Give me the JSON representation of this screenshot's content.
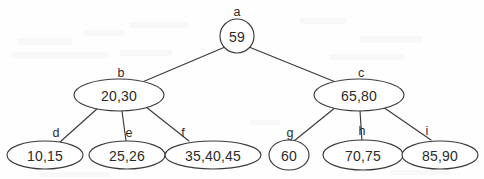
{
  "figure": {
    "type": "tree-diagram",
    "width": 484,
    "height": 179,
    "background_color": "#fefefe",
    "stroke_color": "#3a3a3a",
    "text_color": "#2b2b2b"
  },
  "nodes": {
    "a": {
      "label": "a",
      "value": "59",
      "shape": "circle",
      "level": 0,
      "cx": 237,
      "cy": 36,
      "rx": 17,
      "ry": 17,
      "label_x": 237,
      "label_y": 12
    },
    "b": {
      "label": "b",
      "value": "20,30",
      "shape": "ellipse",
      "level": 1,
      "cx": 119,
      "cy": 95,
      "rx": 45,
      "ry": 16,
      "label_x": 121,
      "label_y": 73
    },
    "c": {
      "label": "c",
      "value": "65,80",
      "shape": "ellipse",
      "level": 1,
      "cx": 359,
      "cy": 95,
      "rx": 45,
      "ry": 16,
      "label_x": 361,
      "label_y": 73
    },
    "d": {
      "label": "d",
      "value": "10,15",
      "shape": "ellipse",
      "level": 2,
      "cx": 45,
      "cy": 155,
      "rx": 38,
      "ry": 14,
      "label_x": 56,
      "label_y": 133
    },
    "e": {
      "label": "e",
      "value": "25,26",
      "shape": "ellipse",
      "level": 2,
      "cx": 127,
      "cy": 155,
      "rx": 38,
      "ry": 14,
      "label_x": 129,
      "label_y": 133
    },
    "f": {
      "label": "f",
      "value": "35,40,45",
      "shape": "ellipse",
      "level": 2,
      "cx": 213,
      "cy": 155,
      "rx": 48,
      "ry": 14,
      "label_x": 183,
      "label_y": 133
    },
    "g": {
      "label": "g",
      "value": "60",
      "shape": "circle",
      "level": 2,
      "cx": 289,
      "cy": 155,
      "rx": 20,
      "ry": 15,
      "label_x": 290,
      "label_y": 133
    },
    "h": {
      "label": "h",
      "value": "70,75",
      "shape": "ellipse",
      "level": 2,
      "cx": 363,
      "cy": 155,
      "rx": 40,
      "ry": 15,
      "label_x": 362,
      "label_y": 131
    },
    "i": {
      "label": "i",
      "value": "85,90",
      "shape": "ellipse",
      "level": 2,
      "cx": 440,
      "cy": 155,
      "rx": 38,
      "ry": 14,
      "label_x": 427,
      "label_y": 131
    }
  },
  "edges": [
    {
      "name": "edge-a-b",
      "from": "a",
      "to": "b",
      "x1": 225,
      "y1": 47,
      "x2": 140,
      "y2": 83
    },
    {
      "name": "edge-a-c",
      "from": "a",
      "to": "c",
      "x1": 249,
      "y1": 47,
      "x2": 338,
      "y2": 83
    },
    {
      "name": "edge-b-d",
      "from": "b",
      "to": "d",
      "x1": 98,
      "y1": 108,
      "x2": 60,
      "y2": 142
    },
    {
      "name": "edge-b-e",
      "from": "b",
      "to": "e",
      "x1": 122,
      "y1": 111,
      "x2": 126,
      "y2": 141
    },
    {
      "name": "edge-b-f",
      "from": "b",
      "to": "f",
      "x1": 146,
      "y1": 107,
      "x2": 189,
      "y2": 141
    },
    {
      "name": "edge-c-g",
      "from": "c",
      "to": "g",
      "x1": 336,
      "y1": 107,
      "x2": 294,
      "y2": 141
    },
    {
      "name": "edge-c-h",
      "from": "c",
      "to": "h",
      "x1": 360,
      "y1": 111,
      "x2": 362,
      "y2": 141
    },
    {
      "name": "edge-c-i",
      "from": "c",
      "to": "i",
      "x1": 383,
      "y1": 107,
      "x2": 431,
      "y2": 140
    }
  ],
  "tree_structure": {
    "root": "a",
    "children": {
      "a": [
        "b",
        "c"
      ],
      "b": [
        "d",
        "e",
        "f"
      ],
      "c": [
        "g",
        "h",
        "i"
      ]
    }
  }
}
